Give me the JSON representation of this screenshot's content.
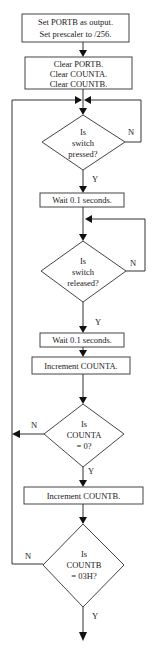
{
  "flowchart": {
    "process_1": {
      "lines": [
        "Set PORTB as output.",
        "Set prescaler to /256."
      ]
    },
    "process_2": {
      "lines": [
        "Clear PORTB.",
        "Clear COUNTA.",
        "Clear COUNTB."
      ]
    },
    "decision_1": {
      "lines": [
        "Is",
        "switch",
        "pressed?"
      ],
      "no_label": "N",
      "yes_label": "Y"
    },
    "process_3": {
      "lines": [
        "Wait 0.1 seconds."
      ]
    },
    "decision_2": {
      "lines": [
        "Is",
        "switch",
        "released?"
      ],
      "no_label": "N",
      "yes_label": "Y"
    },
    "process_4": {
      "lines": [
        "Wait 0.1 seconds."
      ]
    },
    "process_5": {
      "lines": [
        "Increment COUNTA."
      ]
    },
    "decision_3": {
      "lines": [
        "Is",
        "COUNTA",
        "= 0?"
      ],
      "no_label": "N",
      "yes_label": "Y"
    },
    "process_6": {
      "lines": [
        "Increment COUNTB."
      ]
    },
    "decision_4": {
      "lines": [
        "Is",
        "COUNTB",
        "= 03H?"
      ],
      "no_label": "N",
      "yes_label": "Y"
    }
  },
  "colors": {
    "line": "#333333",
    "arrow": "#111111",
    "text": "#222222",
    "background": "#ffffff"
  }
}
